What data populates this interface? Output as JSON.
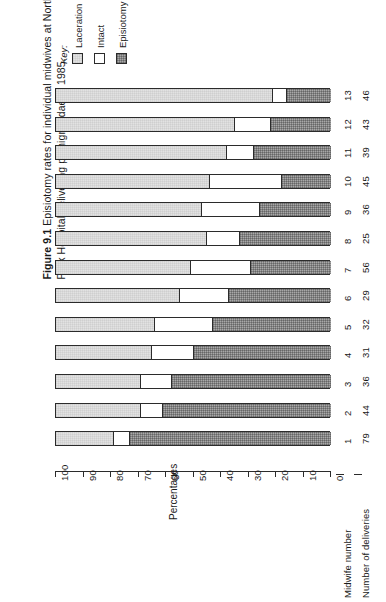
{
  "figure": {
    "number": "Figure 9.1",
    "caption": "Episiotomy rates for individual midwives at Northwick Park Hospital delivering primigravidae in 1985."
  },
  "key": {
    "title": "Key:",
    "items": [
      {
        "label": "Laceration",
        "swatch": "light-grey-stipple",
        "color": "#e2e2e2"
      },
      {
        "label": "Intact",
        "swatch": "white",
        "color": "#ffffff"
      },
      {
        "label": "Episiotomy",
        "swatch": "dark-grey-hatch",
        "color": "#a8a8a8"
      }
    ]
  },
  "row_headers": {
    "midwife": "Midwife number",
    "deliveries": "Number of deliveries"
  },
  "chart_data": {
    "type": "bar",
    "orientation": "horizontal-stacked-rotated",
    "title": "Episiotomy rates for individual midwives at Northwick Park Hospital delivering primigravidae in 1985.",
    "xlabel": "",
    "ylabel": "Percentages",
    "ylim": [
      0,
      100
    ],
    "axis_reversed": true,
    "ticks": [
      100,
      90,
      80,
      70,
      60,
      50,
      40,
      30,
      20,
      10,
      0
    ],
    "grid": false,
    "legend_position": "top-left",
    "categories": [
      "1",
      "2",
      "3",
      "4",
      "5",
      "6",
      "7",
      "8",
      "9",
      "10",
      "11",
      "12",
      "13"
    ],
    "deliveries": [
      79,
      44,
      36,
      31,
      32,
      29,
      56,
      25,
      36,
      45,
      39,
      43,
      46
    ],
    "series": [
      {
        "name": "Laceration",
        "values": [
          21,
          31,
          31,
          35,
          36,
          45,
          49,
          55,
          53,
          56,
          62,
          65,
          79
        ]
      },
      {
        "name": "Intact",
        "values": [
          6,
          8,
          11,
          15,
          21,
          18,
          22,
          12,
          21,
          26,
          10,
          13,
          5
        ]
      },
      {
        "name": "Episiotomy",
        "values": [
          73,
          61,
          58,
          50,
          43,
          37,
          29,
          33,
          26,
          18,
          28,
          22,
          16
        ]
      }
    ]
  }
}
